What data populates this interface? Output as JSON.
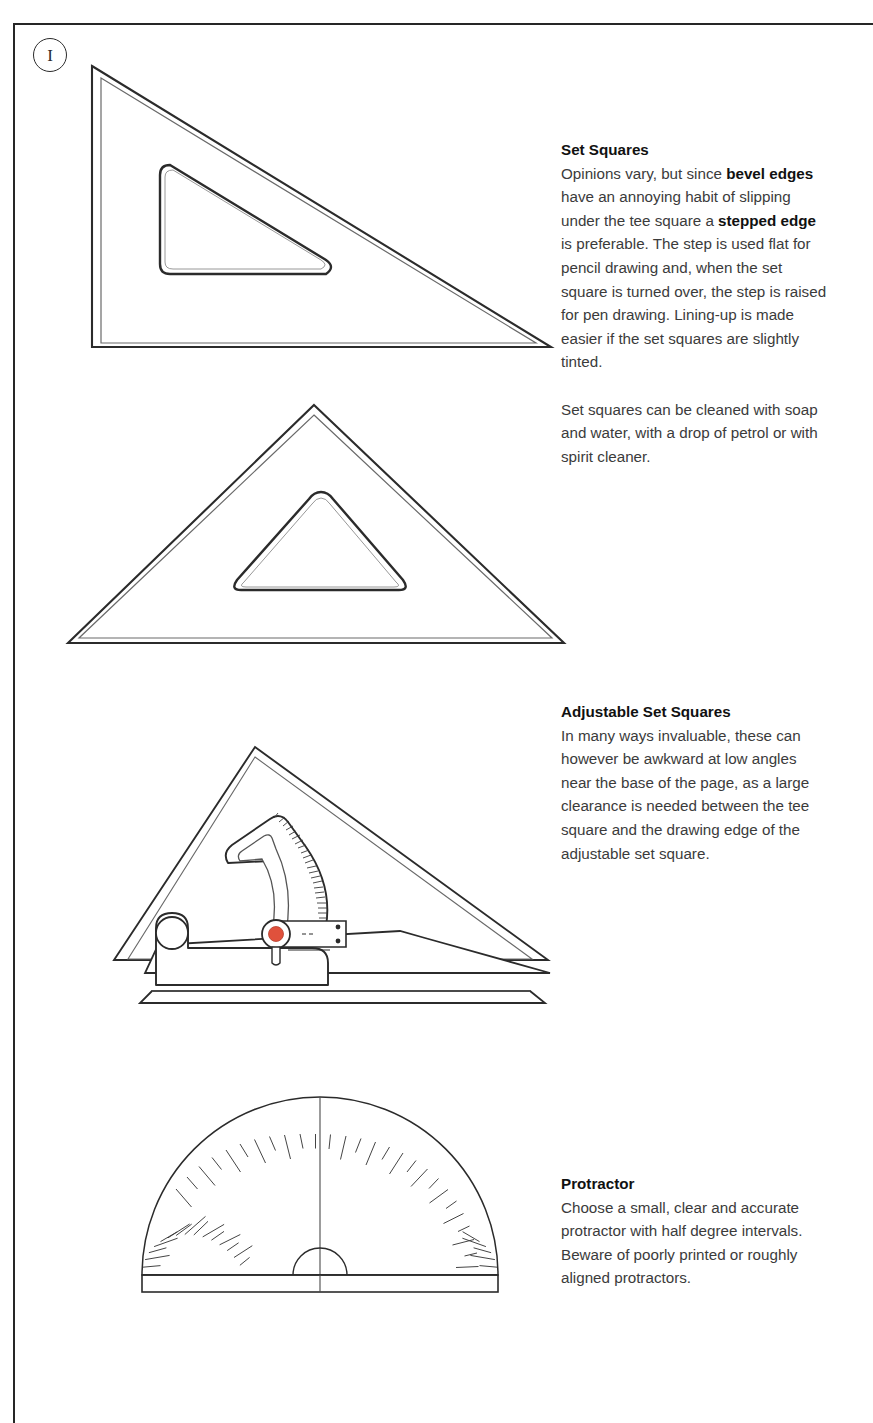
{
  "page": {
    "number": "I",
    "background_color": "#ffffff",
    "border_color": "#262626",
    "text_color": "#3b3b3b",
    "heading_color": "#111111",
    "ink_color": "#2b2b2b",
    "accent_color": "#e0513c"
  },
  "sections": [
    {
      "id": "set-squares",
      "heading": "Set Squares",
      "paragraphs": [
        {
          "runs": [
            {
              "text": "Opinions vary, but since ",
              "bold": false
            },
            {
              "text": "bevel edges",
              "bold": true
            },
            {
              "text": " have an annoying habit of slipping under the tee square a ",
              "bold": false
            },
            {
              "text": "stepped edge",
              "bold": true
            },
            {
              "text": " is preferable. The step is used flat for pencil drawing and, when the set square is turned over, the step is raised for pen drawing. Lining-up is made easier if the set squares are slightly tinted.",
              "bold": false
            }
          ]
        },
        {
          "runs": [
            {
              "text": "Set squares can be cleaned with soap and water, with a drop of petrol or with spirit cleaner.",
              "bold": false
            }
          ]
        }
      ]
    },
    {
      "id": "adjustable-set-squares",
      "heading": "Adjustable Set Squares",
      "paragraphs": [
        {
          "runs": [
            {
              "text": "In many ways invaluable, these can however be awkward at low angles near the base of the page, as a large clearance is needed between the tee square and the drawing edge of the adjustable set square.",
              "bold": false
            }
          ]
        }
      ]
    },
    {
      "id": "protractor",
      "heading": "Protractor",
      "paragraphs": [
        {
          "runs": [
            {
              "text": "Choose a small, clear and accurate protractor with half degree intervals. Beware of poorly printed or roughly aligned protractors.",
              "bold": false
            }
          ]
        }
      ]
    }
  ],
  "figures": [
    {
      "id": "set-square-60-30",
      "name": "60/30 degree set square, right triangle with rounded triangular cutout"
    },
    {
      "id": "set-square-45-45",
      "name": "45/45 degree set square, isosceles triangle with rounded triangular cutout"
    },
    {
      "id": "adjustable-set-square",
      "name": "Adjustable set square with protractor scale, pivot knob and base handle"
    },
    {
      "id": "protractor-semicircle",
      "name": "Semicircular protractor with half degree tick intervals"
    }
  ]
}
